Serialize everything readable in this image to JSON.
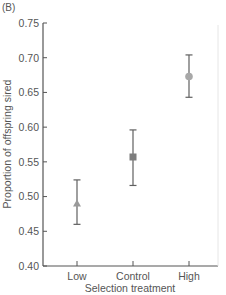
{
  "panel_label": "(B)",
  "chart_data": {
    "type": "scatter",
    "title": "",
    "xlabel": "Selection treatment",
    "ylabel": "Proportion of offspring sired",
    "categories": [
      "Low",
      "Control",
      "High"
    ],
    "values": [
      0.49,
      0.557,
      0.673
    ],
    "error_upper": [
      0.524,
      0.596,
      0.704
    ],
    "error_lower": [
      0.46,
      0.516,
      0.643
    ],
    "markers": [
      "triangle",
      "square",
      "circle"
    ],
    "ylim": [
      0.4,
      0.75
    ],
    "yticks": [
      "0.40",
      "0.45",
      "0.50",
      "0.55",
      "0.60",
      "0.65",
      "0.70",
      "0.75"
    ],
    "grid": false,
    "legend": null,
    "colors": {
      "axis": "#555555",
      "marker": "#8a8a8a",
      "errorbar": "#606060"
    }
  }
}
